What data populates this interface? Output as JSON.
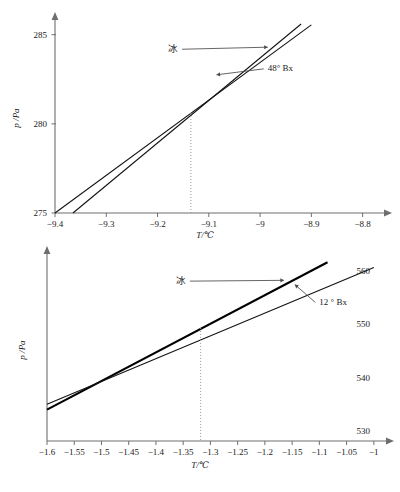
{
  "chart_data": [
    {
      "id": "top",
      "type": "line",
      "title": "",
      "xlabel": "T/℃",
      "ylabel": "p /Pa",
      "xlim": [
        -9.4,
        -8.77
      ],
      "ylim": [
        275,
        285.6
      ],
      "xticks": [
        -9.4,
        -9.3,
        -9.2,
        -9.1,
        -9,
        -8.9,
        -8.8
      ],
      "xticklabels": [
        "−9.4",
        "−9.3",
        "−9.2",
        "−9.1",
        "−9",
        "−8.9",
        "−8.8"
      ],
      "yticks": [
        275,
        280,
        285
      ],
      "yticklabels": [
        "275",
        "280",
        "285"
      ],
      "ytick_side": "left",
      "grid": false,
      "legend": "none",
      "series": [
        {
          "name": "冰",
          "label": "冰",
          "style": "thin",
          "points": [
            [
              -9.4,
              275.0
            ],
            [
              -8.9,
              285.55
            ]
          ]
        },
        {
          "name": "48° Bx",
          "label": "48° Bx",
          "style": "thin",
          "points": [
            [
              -9.365,
              275.0
            ],
            [
              -8.92,
              285.6
            ]
          ]
        }
      ],
      "intersection": {
        "x": -9.135,
        "y": 280.6
      },
      "guide_line": {
        "x": -9.135,
        "from_y": 275,
        "to_y": 280.6,
        "style": "dotted"
      },
      "annotations": [
        {
          "text": "冰",
          "x": -9.16,
          "y": 284.05,
          "leader_to_x": -8.985,
          "leader_to_y": 284.3
        },
        {
          "text": "48° Bx",
          "x": -8.985,
          "y": 282.95,
          "leader_to_x": -9.085,
          "leader_to_y": 282.75
        }
      ]
    },
    {
      "id": "bottom",
      "type": "line",
      "title": "",
      "xlabel": "T/℃",
      "ylabel": "p /Pa",
      "xlim": [
        -1.6,
        -0.985
      ],
      "ylim": [
        528.0,
        562.4
      ],
      "xticks": [
        -1.6,
        -1.55,
        -1.5,
        -1.45,
        -1.4,
        -1.35,
        -1.3,
        -1.25,
        -1.2,
        -1.15,
        -1.1,
        -1.05,
        -1
      ],
      "xticklabels": [
        "−1.6",
        "−1.55",
        "−1.5",
        "−1.45",
        "−1.4",
        "−1.35",
        "−1.3",
        "−1.25",
        "−1.2",
        "−1.15",
        "−1.1",
        "−1.05",
        "−1"
      ],
      "yticks": [
        530,
        540,
        550,
        560
      ],
      "yticklabels": [
        "530",
        "540",
        "550",
        "560"
      ],
      "ytick_side": "right",
      "grid": false,
      "legend": "none",
      "series": [
        {
          "name": "冰",
          "label": "冰",
          "style": "thick",
          "points": [
            [
              -1.6,
              533.9
            ],
            [
              -1.085,
              561.6
            ]
          ]
        },
        {
          "name": "12 ° Bx",
          "label": "12 ° Bx",
          "style": "thin",
          "points": [
            [
              -1.6,
              534.9
            ],
            [
              -1.0,
              560.6
            ]
          ]
        }
      ],
      "intersection": {
        "x": -1.318,
        "y": 549.4
      },
      "guide_line": {
        "x": -1.318,
        "from_y": 528.2,
        "to_y": 549.4,
        "style": "dotted"
      },
      "annotations": [
        {
          "text": "冰",
          "x": -1.345,
          "y": 557.6,
          "leader_to_x": -1.165,
          "leader_to_y": 558.2
        },
        {
          "text": "12 ° Bx",
          "x": -1.1,
          "y": 553.6,
          "leader_to_x": -1.145,
          "leader_to_y": 557.4
        }
      ]
    }
  ],
  "figures": {
    "top": {
      "xlabel": "T/℃",
      "ylabel": "p /Pa",
      "xticklabels": [
        "−9.4",
        "−9.3",
        "−9.2",
        "−9.1",
        "−9",
        "−8.9",
        "−8.8"
      ],
      "yticklabels": [
        "275",
        "280",
        "285"
      ],
      "annot_ice": "冰",
      "annot_bx": "48° Bx"
    },
    "bottom": {
      "xlabel": "T/℃",
      "ylabel": "p /Pa",
      "xticklabels": [
        "−1.6",
        "−1.55",
        "−1.5",
        "−1.45",
        "−1.4",
        "−1.35",
        "−1.3",
        "−1.25",
        "−1.2",
        "−1.15",
        "−1.1",
        "−1.05",
        "−1"
      ],
      "yticklabels": [
        "530",
        "540",
        "550",
        "560"
      ],
      "annot_ice": "冰",
      "annot_bx": "12 ° Bx"
    }
  },
  "colors": {
    "axis": "#6e6e6e",
    "series": "#000000",
    "guide": "#9a9a9a",
    "leader": "#4a4a4a",
    "background": "#ffffff"
  }
}
